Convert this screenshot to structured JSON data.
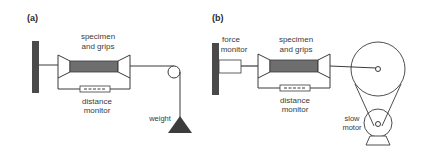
{
  "colors": {
    "line": "#3a3a3a",
    "wall": "#4a4a4a",
    "specimen": "#6e6e6e",
    "weight": "#3c3c3c",
    "background": "#ffffff"
  },
  "panel_a": {
    "label": "(a)",
    "specimen_label_line1": "specimen",
    "specimen_label_line2": "and grips",
    "distance_label_line1": "distance",
    "distance_label_line2": "monitor",
    "weight_label": "weight"
  },
  "panel_b": {
    "label": "(b)",
    "force_label_line1": "force",
    "force_label_line2": "monitor",
    "specimen_label_line1": "specimen",
    "specimen_label_line2": "and grips",
    "distance_label_line1": "distance",
    "distance_label_line2": "monitor",
    "motor_label_line1": "slow",
    "motor_label_line2": "motor"
  }
}
